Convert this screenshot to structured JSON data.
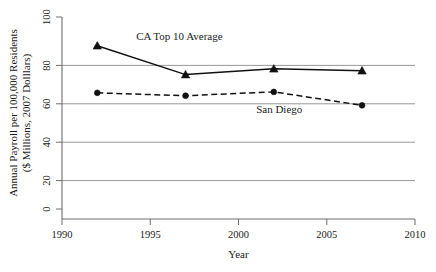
{
  "chart_data": {
    "type": "line",
    "title": "",
    "subtitle": "",
    "xlabel": "Year",
    "ylabel_line1": "Annual Payroll per 100,000 Residents",
    "ylabel_line2": "($ Millions, 2007 Dolllars)",
    "xlim": [
      1990,
      2010
    ],
    "ylim": [
      0,
      100
    ],
    "xticks": [
      1990,
      1995,
      2000,
      2005,
      2010
    ],
    "xtick_labels": [
      "1990",
      "1995",
      "2000",
      "2005",
      "2010"
    ],
    "yticks": [
      0,
      20,
      40,
      60,
      80,
      100
    ],
    "ytick_labels": [
      "0",
      "20",
      "40",
      "60",
      "80",
      "100"
    ],
    "gridlines_y": [
      20,
      40,
      60,
      80
    ],
    "grid": "horizontal",
    "legend_position": "inline-annotations",
    "x": [
      1992,
      1997,
      2002,
      2007
    ],
    "series": [
      {
        "name": "CA Top 10 Average",
        "values": [
          85,
          70,
          73,
          72
        ],
        "line_style": "solid",
        "marker": "triangle",
        "color": "#111111"
      },
      {
        "name": "San Diego",
        "values": [
          60.5,
          59,
          61,
          54
        ],
        "line_style": "dashed",
        "marker": "circle",
        "color": "#111111"
      }
    ],
    "annotations": [
      {
        "text": "CA Top 10 Average",
        "x": 1994.2,
        "y": 88
      },
      {
        "text": "San Diego",
        "x": 2001.0,
        "y": 50
      }
    ]
  }
}
